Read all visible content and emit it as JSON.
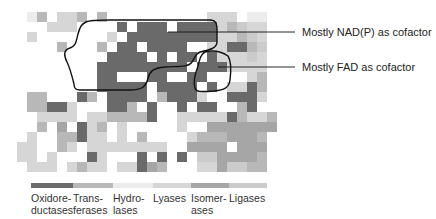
{
  "annotations": [
    {
      "label": "Mostly NAD(P) as cofactor",
      "x": 302,
      "y": 26
    },
    {
      "label": "Mostly FAD as cofactor",
      "x": 302,
      "y": 62
    }
  ],
  "legend": [
    {
      "label_line1": "Oxidore-",
      "label_line2": "ductases",
      "color": "#6a6a6a",
      "x": 31,
      "w": 42
    },
    {
      "label_line1": "Trans-",
      "label_line2": "ferases",
      "color": "#b8b8b8",
      "x": 73,
      "w": 40
    },
    {
      "label_line1": "Hydro-",
      "label_line2": "lases",
      "color": "#ececec",
      "x": 113,
      "w": 40
    },
    {
      "label_line1": "Lyases",
      "label_line2": "",
      "color": "#d6d6d6",
      "x": 153,
      "w": 38
    },
    {
      "label_line1": "Isomer-",
      "label_line2": "ases",
      "color": "#a6a6a6",
      "x": 191,
      "w": 38
    },
    {
      "label_line1": "Ligases",
      "label_line2": "",
      "color": "#cbcbcb",
      "x": 229,
      "w": 38
    }
  ],
  "grid": {
    "cols": 26,
    "rows": 16,
    "legend_levels": {
      "0": "#ffffff",
      "1": "#ececec",
      "2": "#d6d6d6",
      "3": "#cbcbcb",
      "4": "#b8b8b8",
      "5": "#a6a6a6",
      "6": "#6a6a6a"
    },
    "cells": [
      "01402240400000000002220110",
      "00022200006066606666243220",
      "02000000020666666666224320",
      "00004000406606666002266430",
      "00000000066660606606222320",
      "00000000666666666066622220",
      "00000000660006600660000240",
      "00000000666660666606022640",
      "04400064066660466620066620",
      "04466200066406006066004600",
      "00222202244446002222264224",
      "00405062402000002005555555",
      "02004462202040000244455540",
      "22004202222222200555505550",
      "22020006200060606033555540",
      "02220242202265400022533440"
    ]
  },
  "chart_data": {
    "type": "heatmap",
    "title": "",
    "annotations": [
      "Mostly NAD(P) as cofactor",
      "Mostly FAD as cofactor"
    ],
    "legend": [
      "Oxidoreductases",
      "Transferases",
      "Hydrolases",
      "Lyases",
      "Isomerases",
      "Ligases"
    ],
    "rows": 16,
    "cols": 26
  }
}
